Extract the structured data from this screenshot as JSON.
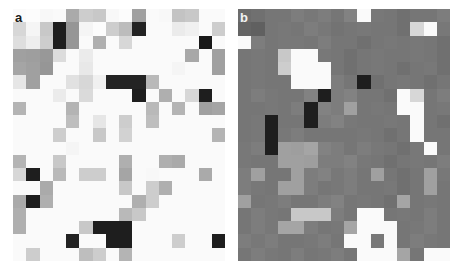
{
  "figure": {
    "caption": "",
    "background_color": "#ffffff",
    "width": 459,
    "height": 271
  },
  "panels": [
    {
      "id": "a",
      "label": "a",
      "label_color": "#1a1a1a",
      "x": 13,
      "y": 9,
      "width": 212,
      "height": 252,
      "cols": 16,
      "rows": 19
    },
    {
      "id": "b",
      "label": "b",
      "label_color": "#f2f2f2",
      "x": 238,
      "y": 9,
      "width": 212,
      "height": 252,
      "cols": 16,
      "rows": 19
    }
  ],
  "chart_data": [
    {
      "type": "heatmap",
      "panel": "a",
      "title": "a",
      "xlabel": "",
      "ylabel": "",
      "grid": false,
      "legend": "none",
      "colormap": "grayscale",
      "value_range": [
        0,
        255
      ],
      "cols": 16,
      "rows": 19,
      "x": [
        1,
        2,
        3,
        4,
        5,
        6,
        7,
        8,
        9,
        10,
        11,
        12,
        13,
        14,
        15,
        16
      ],
      "y": [
        1,
        2,
        3,
        4,
        5,
        6,
        7,
        8,
        9,
        10,
        11,
        12,
        13,
        14,
        15,
        16,
        17,
        18,
        19
      ],
      "values": [
        [
          250,
          252,
          248,
          250,
          170,
          205,
          200,
          248,
          252,
          160,
          250,
          248,
          195,
          200,
          250,
          250
        ],
        [
          215,
          245,
          200,
          30,
          150,
          245,
          252,
          205,
          188,
          35,
          250,
          250,
          235,
          240,
          250,
          205
        ],
        [
          222,
          238,
          205,
          30,
          150,
          250,
          175,
          250,
          215,
          250,
          250,
          250,
          250,
          250,
          25,
          250
        ],
        [
          160,
          158,
          152,
          220,
          250,
          235,
          250,
          250,
          250,
          250,
          250,
          250,
          250,
          168,
          250,
          160
        ],
        [
          165,
          160,
          150,
          250,
          250,
          232,
          250,
          250,
          250,
          250,
          250,
          250,
          245,
          250,
          250,
          160
        ],
        [
          230,
          160,
          250,
          250,
          225,
          215,
          240,
          35,
          35,
          35,
          185,
          250,
          250,
          250,
          250,
          250
        ],
        [
          250,
          250,
          250,
          235,
          250,
          218,
          250,
          250,
          250,
          30,
          250,
          175,
          250,
          215,
          30,
          250
        ],
        [
          180,
          250,
          250,
          250,
          180,
          250,
          250,
          250,
          250,
          250,
          185,
          250,
          180,
          250,
          160,
          165
        ],
        [
          250,
          250,
          250,
          250,
          190,
          250,
          230,
          250,
          205,
          250,
          190,
          250,
          250,
          250,
          250,
          250
        ],
        [
          250,
          250,
          250,
          205,
          250,
          250,
          200,
          250,
          210,
          250,
          250,
          250,
          250,
          250,
          250,
          180
        ],
        [
          250,
          250,
          250,
          250,
          245,
          250,
          250,
          250,
          250,
          250,
          250,
          250,
          250,
          250,
          250,
          250
        ],
        [
          180,
          250,
          250,
          200,
          250,
          250,
          250,
          250,
          175,
          250,
          250,
          175,
          170,
          250,
          250,
          250
        ],
        [
          215,
          30,
          250,
          185,
          250,
          205,
          205,
          250,
          165,
          250,
          248,
          250,
          250,
          250,
          170,
          250
        ],
        [
          250,
          250,
          170,
          250,
          250,
          250,
          250,
          250,
          200,
          250,
          205,
          175,
          250,
          250,
          250,
          250
        ],
        [
          170,
          30,
          175,
          250,
          250,
          250,
          250,
          250,
          250,
          175,
          205,
          250,
          250,
          250,
          250,
          250
        ],
        [
          175,
          250,
          250,
          250,
          250,
          250,
          250,
          250,
          185,
          200,
          250,
          250,
          250,
          250,
          250,
          250
        ],
        [
          175,
          250,
          250,
          250,
          250,
          200,
          30,
          30,
          30,
          250,
          250,
          250,
          250,
          250,
          250,
          250
        ],
        [
          250,
          250,
          250,
          250,
          35,
          250,
          250,
          30,
          30,
          250,
          250,
          250,
          205,
          250,
          250,
          30
        ],
        [
          250,
          205,
          250,
          250,
          250,
          190,
          205,
          250,
          180,
          250,
          250,
          250,
          250,
          250,
          250,
          250
        ]
      ]
    },
    {
      "type": "heatmap",
      "panel": "b",
      "title": "b",
      "xlabel": "",
      "ylabel": "",
      "grid": false,
      "legend": "none",
      "colormap": "grayscale",
      "value_range": [
        0,
        255
      ],
      "cols": 16,
      "rows": 19,
      "x": [
        1,
        2,
        3,
        4,
        5,
        6,
        7,
        8,
        9,
        10,
        11,
        12,
        13,
        14,
        15,
        16
      ],
      "y": [
        1,
        2,
        3,
        4,
        5,
        6,
        7,
        8,
        9,
        10,
        11,
        12,
        13,
        14,
        15,
        16,
        17,
        18,
        19
      ],
      "values": [
        [
          108,
          112,
          118,
          118,
          125,
          120,
          125,
          118,
          130,
          250,
          120,
          118,
          112,
          118,
          118,
          125
        ],
        [
          100,
          96,
          118,
          120,
          118,
          125,
          120,
          115,
          118,
          120,
          118,
          118,
          112,
          215,
          250,
          120
        ],
        [
          250,
          125,
          118,
          120,
          120,
          118,
          125,
          118,
          118,
          112,
          118,
          120,
          118,
          120,
          118,
          112
        ],
        [
          118,
          120,
          118,
          200,
          250,
          250,
          120,
          118,
          112,
          118,
          120,
          118,
          118,
          120,
          118,
          112
        ],
        [
          118,
          120,
          118,
          205,
          250,
          250,
          250,
          118,
          112,
          118,
          120,
          118,
          112,
          118,
          120,
          112
        ],
        [
          118,
          120,
          118,
          118,
          250,
          250,
          250,
          125,
          118,
          30,
          112,
          118,
          120,
          118,
          112,
          118
        ],
        [
          118,
          125,
          120,
          118,
          118,
          130,
          30,
          125,
          130,
          118,
          118,
          112,
          250,
          215,
          118,
          125
        ],
        [
          118,
          118,
          120,
          118,
          125,
          30,
          130,
          125,
          160,
          118,
          120,
          118,
          250,
          250,
          118,
          120
        ],
        [
          118,
          120,
          30,
          118,
          118,
          30,
          125,
          130,
          120,
          118,
          118,
          120,
          118,
          250,
          118,
          112
        ],
        [
          118,
          120,
          30,
          120,
          125,
          118,
          118,
          118,
          118,
          120,
          118,
          112,
          118,
          250,
          118,
          118
        ],
        [
          120,
          125,
          30,
          160,
          158,
          165,
          130,
          125,
          118,
          125,
          120,
          118,
          112,
          120,
          250,
          118
        ],
        [
          120,
          118,
          118,
          160,
          160,
          158,
          125,
          125,
          130,
          120,
          118,
          112,
          118,
          120,
          118,
          125
        ],
        [
          125,
          160,
          118,
          118,
          160,
          125,
          130,
          120,
          125,
          118,
          160,
          118,
          112,
          118,
          160,
          120
        ],
        [
          125,
          120,
          118,
          160,
          160,
          125,
          118,
          120,
          125,
          118,
          118,
          120,
          112,
          118,
          160,
          118
        ],
        [
          160,
          118,
          120,
          125,
          118,
          118,
          125,
          130,
          118,
          120,
          118,
          112,
          165,
          118,
          120,
          118
        ],
        [
          118,
          125,
          120,
          118,
          200,
          200,
          200,
          125,
          118,
          250,
          250,
          118,
          120,
          118,
          125,
          118
        ],
        [
          118,
          125,
          120,
          165,
          165,
          125,
          118,
          120,
          165,
          250,
          250,
          250,
          118,
          120,
          125,
          118
        ],
        [
          125,
          120,
          125,
          118,
          118,
          120,
          125,
          118,
          250,
          250,
          120,
          250,
          118,
          125,
          120,
          118
        ],
        [
          118,
          125,
          120,
          118,
          125,
          118,
          120,
          125,
          118,
          250,
          250,
          250,
          165,
          118,
          250,
          250
        ]
      ]
    }
  ]
}
